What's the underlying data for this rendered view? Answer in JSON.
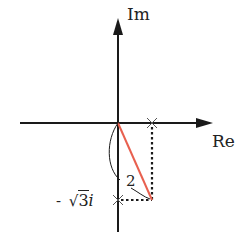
{
  "diagram": {
    "type": "complex-plane",
    "axes": {
      "real_label": "Re",
      "imag_label": "Im"
    },
    "labels": {
      "neg_sqrt3_minus": "-",
      "neg_sqrt3_radical": "√",
      "neg_sqrt3_value": "3",
      "neg_sqrt3_i": "i",
      "modulus": "2"
    },
    "points": {
      "real_mark": {
        "re": 1,
        "im": 0
      },
      "imag_mark": {
        "re": 0,
        "im": -1.732
      },
      "complex_point": {
        "re": 1,
        "im": -1.732
      }
    },
    "colors": {
      "axis": "#1a1a1a",
      "vector": "#e8604f",
      "dotted": "#1a1a1a"
    }
  }
}
